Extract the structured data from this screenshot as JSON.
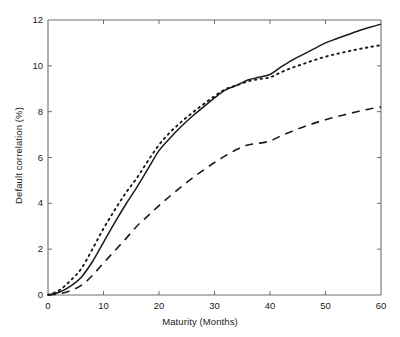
{
  "chart_data": {
    "type": "line",
    "title": "",
    "xlabel": "Maturity (Months)",
    "ylabel": "Default correlation (%)",
    "xlim": [
      0,
      60
    ],
    "ylim": [
      0,
      12
    ],
    "xticks": [
      "0",
      "10",
      "20",
      "30",
      "40",
      "50",
      "60"
    ],
    "yticks": [
      "0",
      "2",
      "4",
      "6",
      "8",
      "10",
      "12"
    ],
    "grid": false,
    "legend": "none",
    "axis_color": "#6e6e6e",
    "line_color": "#1a1a1a",
    "x": [
      0,
      2,
      4,
      6,
      8,
      10,
      12,
      14,
      16,
      18,
      20,
      22,
      24,
      26,
      28,
      30,
      32,
      34,
      36,
      38,
      40,
      42,
      44,
      46,
      48,
      50,
      52,
      54,
      56,
      58,
      60
    ],
    "series": [
      {
        "name": "solid",
        "style": "solid",
        "values": [
          0.0,
          0.12,
          0.38,
          0.78,
          1.45,
          2.3,
          3.15,
          3.95,
          4.7,
          5.5,
          6.3,
          6.85,
          7.35,
          7.8,
          8.2,
          8.6,
          8.95,
          9.15,
          9.38,
          9.5,
          9.62,
          9.95,
          10.25,
          10.5,
          10.75,
          11.0,
          11.18,
          11.36,
          11.53,
          11.68,
          11.82
        ]
      },
      {
        "name": "dotted",
        "style": "dotted",
        "values": [
          0.0,
          0.2,
          0.62,
          1.15,
          2.0,
          2.9,
          3.7,
          4.45,
          5.1,
          5.85,
          6.55,
          7.1,
          7.55,
          7.95,
          8.32,
          8.68,
          8.98,
          9.15,
          9.32,
          9.42,
          9.5,
          9.72,
          9.92,
          10.08,
          10.25,
          10.4,
          10.52,
          10.63,
          10.73,
          10.82,
          10.9
        ]
      },
      {
        "name": "dashed",
        "style": "dashed",
        "values": [
          0.0,
          0.05,
          0.18,
          0.42,
          0.85,
          1.4,
          1.92,
          2.45,
          3.0,
          3.45,
          3.9,
          4.32,
          4.72,
          5.1,
          5.45,
          5.78,
          6.08,
          6.35,
          6.55,
          6.62,
          6.72,
          6.95,
          7.15,
          7.33,
          7.5,
          7.65,
          7.78,
          7.9,
          8.02,
          8.12,
          8.2
        ]
      }
    ]
  }
}
